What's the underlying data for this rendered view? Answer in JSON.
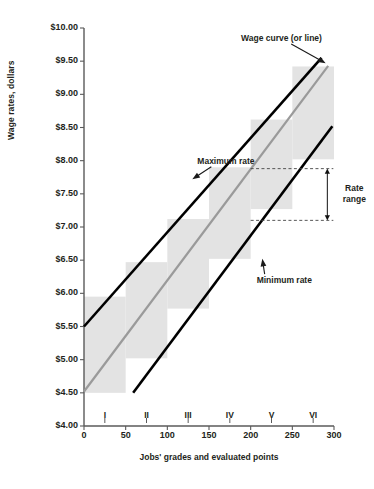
{
  "chart_data": {
    "type": "area",
    "title": "",
    "xlabel": "Jobs' grades and evaluated points",
    "ylabel": "Wage rates, dollars",
    "xlim": [
      0,
      300
    ],
    "ylim": [
      4.0,
      10.0
    ],
    "grid": false,
    "legend": "none",
    "yticks": [
      "$4.00",
      "$4.50",
      "$5.00",
      "$5.50",
      "$6.00",
      "$6.50",
      "$7.00",
      "$7.50",
      "$8.00",
      "$8.50",
      "$9.00",
      "$9.50",
      "$10.00"
    ],
    "ytick_values": [
      4.0,
      4.5,
      5.0,
      5.5,
      6.0,
      6.5,
      7.0,
      7.5,
      8.0,
      8.5,
      9.0,
      9.5,
      10.0
    ],
    "xticks": [
      "0",
      "50",
      "100",
      "150",
      "200",
      "250",
      "300"
    ],
    "xtick_values": [
      0,
      50,
      100,
      150,
      200,
      250,
      300
    ],
    "grade_labels": [
      "I",
      "II",
      "III",
      "IV",
      "V",
      "VI"
    ],
    "grade_centers": [
      25,
      75,
      125,
      175,
      225,
      275
    ],
    "series": [
      {
        "name": "Maximum rate",
        "type": "line",
        "color": "#000000",
        "x": [
          0,
          285
        ],
        "values": [
          5.5,
          9.55
        ]
      },
      {
        "name": "Wage curve (or line)",
        "type": "line",
        "color": "#9a9a9a",
        "x": [
          0,
          293
        ],
        "values": [
          4.52,
          9.43
        ]
      },
      {
        "name": "Minimum rate",
        "type": "line",
        "color": "#000000",
        "x": [
          59,
          298
        ],
        "values": [
          4.5,
          8.52
        ]
      }
    ],
    "rate_range_boxes": [
      {
        "grade": "I",
        "x0": 0,
        "x1": 50,
        "y0": 4.5,
        "y1": 5.95
      },
      {
        "grade": "II",
        "x0": 50,
        "x1": 100,
        "y0": 5.02,
        "y1": 6.47
      },
      {
        "grade": "III",
        "x0": 100,
        "x1": 150,
        "y0": 5.77,
        "y1": 7.12
      },
      {
        "grade": "IV",
        "x0": 150,
        "x1": 200,
        "y0": 6.52,
        "y1": 7.9
      },
      {
        "grade": "V",
        "x0": 200,
        "x1": 250,
        "y0": 7.27,
        "y1": 8.62
      },
      {
        "grade": "VI",
        "x0": 250,
        "x1": 300,
        "y0": 8.02,
        "y1": 9.42
      }
    ],
    "rate_range_marker": {
      "label_line1": "Rate",
      "label_line2": "range",
      "upper": 7.88,
      "lower": 7.1,
      "x_from": 200,
      "x_to": 292
    },
    "annotations": [
      {
        "name": "maximum-rate",
        "text": "Maximum rate",
        "x": 100,
        "y": 8.0
      },
      {
        "name": "minimum-rate",
        "text": "Minimum rate",
        "x": 200,
        "y": 6.2
      },
      {
        "name": "wage-curve",
        "text": "Wage curve (or line)",
        "x": 225,
        "y": 9.85
      }
    ],
    "colors": {
      "box_fill": "#e3e3e3",
      "rate_line": "#000000",
      "wage_curve": "#9a9a9a",
      "axis": "#5a5a5a",
      "dashed": "#444444",
      "text": "#231f20"
    }
  }
}
